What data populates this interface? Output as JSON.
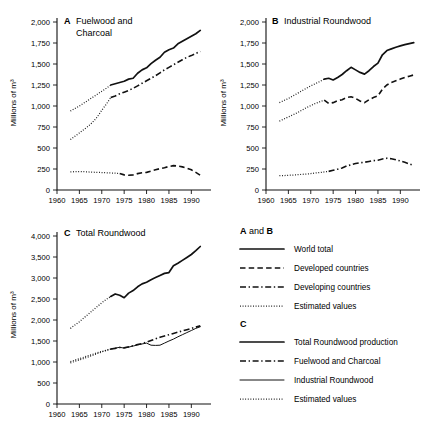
{
  "figure": {
    "ylabel": "Millions of m³",
    "xticks": [
      "1960",
      "1965",
      "1970",
      "1975",
      "1980",
      "1985",
      "1990"
    ],
    "xtick_values": [
      1960,
      1965,
      1970,
      1975,
      1980,
      1985,
      1990
    ],
    "xlim": [
      1960,
      1993.5
    ]
  },
  "panels": {
    "a": {
      "letter": "A",
      "title_line1": "Fuelwood and",
      "title_line2": "Charcoal",
      "title": "Fuelwood and Charcoal",
      "yticks": [
        "0",
        "250",
        "500",
        "750",
        "1,000",
        "1,250",
        "1,500",
        "1,750",
        "2,000"
      ],
      "ytick_values": [
        0,
        250,
        500,
        750,
        1000,
        1250,
        1500,
        1750,
        2000
      ],
      "ylim": [
        0,
        2000
      ]
    },
    "b": {
      "letter": "B",
      "title": "Industrial Roundwood",
      "yticks": [
        "0",
        "250",
        "500",
        "750",
        "1,000",
        "1,250",
        "1,500",
        "1,750",
        "2,000"
      ],
      "ytick_values": [
        0,
        250,
        500,
        750,
        1000,
        1250,
        1500,
        1750,
        2000
      ],
      "ylim": [
        0,
        2000
      ]
    },
    "c": {
      "letter": "C",
      "title": "Total Roundwood",
      "yticks": [
        "0",
        "500",
        "1,000",
        "1,500",
        "2,000",
        "2,500",
        "3,000",
        "3,500",
        "4,000"
      ],
      "ytick_values": [
        0,
        500,
        1000,
        1500,
        2000,
        2500,
        3000,
        3500,
        4000
      ],
      "ylim": [
        0,
        4000
      ]
    }
  },
  "legend": {
    "group_ab_head_bold_1": "A",
    "group_ab_head_mid": " and ",
    "group_ab_head_bold_2": "B",
    "group_ab_items": [
      {
        "label": "World total",
        "style": "solid"
      },
      {
        "label": "Developed countries",
        "style": "dashed"
      },
      {
        "label": "Developing countries",
        "style": "dashdot"
      },
      {
        "label": "Estimated values",
        "style": "dotted"
      }
    ],
    "group_c_head": "C",
    "group_c_items": [
      {
        "label": "Total Roundwood production",
        "style": "solid"
      },
      {
        "label": "Fuelwood and Charcoal",
        "style": "dashdot"
      },
      {
        "label": "Industrial Roundwood",
        "style": "solid-thin"
      },
      {
        "label": "Estimated values",
        "style": "dotted"
      }
    ]
  },
  "chart_data": [
    {
      "type": "line",
      "panel": "A",
      "title": "Fuelwood and Charcoal",
      "xlabel": "",
      "ylabel": "Millions of m³",
      "xlim": [
        1960,
        1993.5
      ],
      "ylim": [
        0,
        2000
      ],
      "grid": false,
      "legend_position": "external-right",
      "series": [
        {
          "name": "World total (estimated)",
          "style": "dotted",
          "x": [
            1963,
            1964,
            1965,
            1966,
            1967,
            1968,
            1969,
            1970,
            1971,
            1972
          ],
          "values": [
            940,
            970,
            1000,
            1035,
            1070,
            1105,
            1140,
            1175,
            1210,
            1250
          ]
        },
        {
          "name": "World total",
          "style": "solid",
          "x": [
            1972,
            1973,
            1974,
            1975,
            1976,
            1977,
            1978,
            1979,
            1980,
            1981,
            1982,
            1983,
            1984,
            1985,
            1986,
            1987,
            1988,
            1989,
            1990,
            1991,
            1992
          ],
          "values": [
            1250,
            1265,
            1280,
            1295,
            1320,
            1330,
            1390,
            1430,
            1455,
            1505,
            1545,
            1580,
            1640,
            1670,
            1690,
            1740,
            1770,
            1800,
            1830,
            1860,
            1900
          ]
        },
        {
          "name": "Developing countries (estimated)",
          "style": "dotted",
          "x": [
            1963,
            1964,
            1965,
            1966,
            1967,
            1968,
            1969,
            1970,
            1971,
            1972
          ],
          "values": [
            600,
            640,
            680,
            720,
            760,
            810,
            870,
            950,
            1020,
            1100
          ]
        },
        {
          "name": "Developing countries",
          "style": "dashdot",
          "x": [
            1972,
            1973,
            1974,
            1975,
            1976,
            1977,
            1978,
            1979,
            1980,
            1981,
            1982,
            1983,
            1984,
            1985,
            1986,
            1987,
            1988,
            1989,
            1990,
            1991,
            1992
          ],
          "values": [
            1100,
            1120,
            1145,
            1165,
            1185,
            1210,
            1240,
            1270,
            1300,
            1330,
            1360,
            1395,
            1430,
            1460,
            1490,
            1520,
            1550,
            1580,
            1600,
            1625,
            1650
          ]
        },
        {
          "name": "Developed countries (estimated)",
          "style": "dotted",
          "x": [
            1963,
            1964,
            1965,
            1966,
            1967,
            1968,
            1969,
            1970,
            1971,
            1972,
            1973,
            1974
          ],
          "values": [
            215,
            218,
            220,
            218,
            215,
            212,
            210,
            208,
            205,
            203,
            200,
            196
          ]
        },
        {
          "name": "Developed countries",
          "style": "dashed",
          "x": [
            1974,
            1975,
            1976,
            1977,
            1978,
            1979,
            1980,
            1981,
            1982,
            1983,
            1984,
            1985,
            1986,
            1987,
            1988,
            1989,
            1990,
            1991,
            1992
          ],
          "values": [
            196,
            180,
            175,
            180,
            195,
            205,
            210,
            225,
            240,
            255,
            265,
            280,
            290,
            285,
            275,
            260,
            240,
            210,
            175
          ]
        }
      ]
    },
    {
      "type": "line",
      "panel": "B",
      "title": "Industrial Roundwood",
      "xlabel": "",
      "ylabel": "Millions of m³",
      "xlim": [
        1960,
        1993.5
      ],
      "ylim": [
        0,
        2000
      ],
      "grid": false,
      "legend_position": "external-right",
      "series": [
        {
          "name": "World total (estimated)",
          "style": "dotted",
          "x": [
            1963,
            1964,
            1965,
            1966,
            1967,
            1968,
            1969,
            1970,
            1971,
            1972,
            1973
          ],
          "values": [
            1040,
            1065,
            1090,
            1120,
            1150,
            1180,
            1210,
            1240,
            1265,
            1290,
            1320
          ]
        },
        {
          "name": "World total",
          "style": "solid",
          "x": [
            1973,
            1974,
            1975,
            1976,
            1977,
            1978,
            1979,
            1980,
            1981,
            1982,
            1983,
            1984,
            1985,
            1986,
            1987,
            1988,
            1989,
            1990,
            1991,
            1992,
            1993
          ],
          "values": [
            1320,
            1330,
            1310,
            1340,
            1375,
            1420,
            1460,
            1430,
            1400,
            1380,
            1420,
            1470,
            1510,
            1610,
            1660,
            1680,
            1700,
            1715,
            1730,
            1742,
            1755
          ]
        },
        {
          "name": "Developed countries (estimated)",
          "style": "dotted",
          "x": [
            1963,
            1964,
            1965,
            1966,
            1967,
            1968,
            1969,
            1970,
            1971,
            1972,
            1973
          ],
          "values": [
            820,
            845,
            870,
            895,
            920,
            950,
            980,
            1005,
            1030,
            1050,
            1070
          ]
        },
        {
          "name": "Developed countries",
          "style": "dashed",
          "x": [
            1973,
            1974,
            1975,
            1976,
            1977,
            1978,
            1979,
            1980,
            1981,
            1982,
            1983,
            1984,
            1985,
            1986,
            1987,
            1988,
            1989,
            1990,
            1991,
            1992,
            1993
          ],
          "values": [
            1070,
            1030,
            1040,
            1065,
            1075,
            1100,
            1110,
            1090,
            1060,
            1040,
            1075,
            1100,
            1120,
            1200,
            1250,
            1280,
            1300,
            1320,
            1340,
            1355,
            1370
          ]
        },
        {
          "name": "Developing countries (estimated)",
          "style": "dotted",
          "x": [
            1963,
            1964,
            1965,
            1966,
            1967,
            1968,
            1969,
            1970,
            1971,
            1972,
            1973,
            1974
          ],
          "values": [
            170,
            172,
            175,
            178,
            182,
            186,
            190,
            196,
            202,
            208,
            215,
            222
          ]
        },
        {
          "name": "Developing countries",
          "style": "dashdot",
          "x": [
            1974,
            1975,
            1976,
            1977,
            1978,
            1979,
            1980,
            1981,
            1982,
            1983,
            1984,
            1985,
            1986,
            1987,
            1988,
            1989,
            1990,
            1991,
            1992,
            1993
          ],
          "values": [
            222,
            235,
            248,
            262,
            285,
            300,
            315,
            325,
            330,
            340,
            350,
            355,
            370,
            378,
            372,
            360,
            345,
            330,
            310,
            290
          ]
        }
      ]
    },
    {
      "type": "line",
      "panel": "C",
      "title": "Total Roundwood",
      "xlabel": "",
      "ylabel": "Millions of m³",
      "xlim": [
        1960,
        1993.5
      ],
      "ylim": [
        0,
        4000
      ],
      "grid": false,
      "legend_position": "external-right",
      "series": [
        {
          "name": "Total Roundwood production (estimated)",
          "style": "dotted",
          "x": [
            1963,
            1964,
            1965,
            1966,
            1967,
            1968,
            1969,
            1970,
            1971,
            1972
          ],
          "values": [
            1800,
            1880,
            1960,
            2050,
            2140,
            2230,
            2320,
            2410,
            2490,
            2560
          ]
        },
        {
          "name": "Total Roundwood production",
          "style": "solid",
          "x": [
            1972,
            1973,
            1974,
            1975,
            1976,
            1977,
            1978,
            1979,
            1980,
            1981,
            1982,
            1983,
            1984,
            1985,
            1986,
            1987,
            1988,
            1989,
            1990,
            1991,
            1992
          ],
          "values": [
            2560,
            2620,
            2590,
            2530,
            2640,
            2700,
            2790,
            2860,
            2900,
            2960,
            3010,
            3060,
            3110,
            3130,
            3290,
            3350,
            3420,
            3490,
            3560,
            3650,
            3750
          ]
        },
        {
          "name": "Fuelwood and Charcoal (estimated)",
          "style": "dotted",
          "x": [
            1963,
            1964,
            1965,
            1966,
            1967,
            1968,
            1969,
            1970,
            1971,
            1972
          ],
          "values": [
            1010,
            1045,
            1080,
            1115,
            1150,
            1185,
            1220,
            1250,
            1280,
            1310
          ]
        },
        {
          "name": "Fuelwood and Charcoal",
          "style": "dashdot",
          "x": [
            1972,
            1973,
            1974,
            1975,
            1976,
            1977,
            1978,
            1979,
            1980,
            1981,
            1982,
            1983,
            1984,
            1985,
            1986,
            1987,
            1988,
            1989,
            1990,
            1991,
            1992
          ],
          "values": [
            1310,
            1325,
            1345,
            1340,
            1360,
            1390,
            1415,
            1440,
            1470,
            1510,
            1550,
            1590,
            1620,
            1650,
            1680,
            1710,
            1740,
            1770,
            1800,
            1830,
            1860
          ]
        },
        {
          "name": "Industrial Roundwood (estimated)",
          "style": "dotted",
          "x": [
            1963,
            1964,
            1965,
            1966,
            1967,
            1968,
            1969,
            1970,
            1971,
            1972
          ],
          "values": [
            980,
            1015,
            1050,
            1085,
            1120,
            1160,
            1200,
            1240,
            1275,
            1305
          ]
        },
        {
          "name": "Industrial Roundwood",
          "style": "solid-thin",
          "x": [
            1972,
            1973,
            1974,
            1975,
            1976,
            1977,
            1978,
            1979,
            1980,
            1981,
            1982,
            1983,
            1984,
            1985,
            1986,
            1987,
            1988,
            1989,
            1990,
            1991,
            1992
          ],
          "values": [
            1305,
            1330,
            1350,
            1330,
            1355,
            1380,
            1405,
            1430,
            1450,
            1400,
            1395,
            1400,
            1450,
            1500,
            1545,
            1600,
            1650,
            1700,
            1750,
            1800,
            1840
          ]
        }
      ]
    }
  ]
}
